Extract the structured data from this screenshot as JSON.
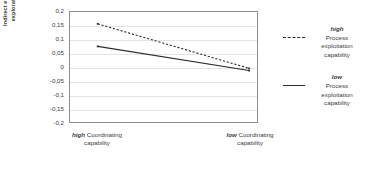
{
  "chart_data": {
    "type": "line",
    "title": "",
    "xlabel": "",
    "ylabel": "Indirect effect of process exploration capability",
    "ylim": [
      -0.2,
      0.2
    ],
    "ytick_values": [
      0.2,
      0.15,
      0.1,
      0.05,
      0,
      -0.05,
      -0.1,
      -0.15,
      -0.2
    ],
    "ytick_labels": [
      "0,2",
      "0,15",
      "0,1",
      "0,05",
      "0",
      "-0,05",
      "-0,1",
      "-0,15",
      "-0,2"
    ],
    "grid": true,
    "legend_position": "right",
    "categories": [
      "high Coordinating capability",
      "low Coordinating capability"
    ],
    "x": [
      0,
      1
    ],
    "series": [
      {
        "name": "high Process exploitation capability",
        "level": "high",
        "label_rest": "Process exploitation capability",
        "style": "dashed",
        "color": "#2b2b2b",
        "values": [
          0.157,
          -0.005
        ]
      },
      {
        "name": "low Process exploitation capability",
        "level": "low",
        "label_rest": "Process exploitation capability",
        "style": "solid",
        "color": "#2b2b2b",
        "values": [
          0.075,
          -0.013
        ]
      }
    ]
  },
  "axes": {
    "y_title_line1": "Indirect effect of process",
    "y_title_line2": "exploration capability",
    "xtick_labels": [
      {
        "level": "high",
        "rest": "Coordinating",
        "line2": "capability"
      },
      {
        "level": "low",
        "rest": "Coordinating",
        "line2": "capability"
      }
    ]
  },
  "legend": {
    "entries": [
      {
        "level": "high",
        "word": "Process",
        "line2": "exploitation",
        "line3": "capability",
        "style": "dashed"
      },
      {
        "level": "low",
        "word": "Process",
        "line2": "exploitation",
        "line3": "capability",
        "style": "solid"
      }
    ]
  },
  "colors": {
    "line": "#2b2b2b",
    "grid": "#e4e4e4",
    "frame": "#8d8d8d",
    "text": "#3b3b3b"
  }
}
